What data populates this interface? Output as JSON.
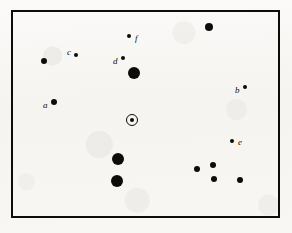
{
  "figure": {
    "type": "star-chart",
    "background_color": "#f7f6f3",
    "ink_color": "#0c0c08",
    "frame": {
      "x": 11,
      "y": 10,
      "width": 269,
      "height": 208,
      "border_width": 2
    }
  },
  "chart_data": {
    "type": "scatter",
    "title": "",
    "subtitle": "",
    "xlabel": "",
    "ylabel": "",
    "grid": false,
    "legend": "none",
    "axes_visible": false,
    "frame_visible": true,
    "xlim": [
      0,
      292
    ],
    "ylim": [
      0,
      233
    ],
    "note": "Positions are image pixel coordinates; y increases downward. Radius encodes apparent brightness (larger = brighter).",
    "marker_styles": [
      "filled-dot",
      "ringed-dot"
    ],
    "points": [
      {
        "id": "p1",
        "label": "",
        "x": 209,
        "y": 27,
        "r": 4.0,
        "style": "filled-dot",
        "label_dx": 0,
        "label_dy": 0
      },
      {
        "id": "p2",
        "label": "f",
        "x": 129,
        "y": 36,
        "r": 2.2,
        "style": "filled-dot",
        "label_dx": 6,
        "label_dy": -2
      },
      {
        "id": "p3",
        "label": "c",
        "x": 76,
        "y": 55,
        "r": 2.4,
        "style": "filled-dot",
        "label_dx": -9,
        "label_dy": -7
      },
      {
        "id": "p4",
        "label": "d",
        "x": 123,
        "y": 58,
        "r": 2.2,
        "style": "filled-dot",
        "label_dx": -10,
        "label_dy": -1
      },
      {
        "id": "p5",
        "label": "",
        "x": 44,
        "y": 61,
        "r": 3.3,
        "style": "filled-dot",
        "label_dx": 0,
        "label_dy": 0
      },
      {
        "id": "p6",
        "label": "",
        "x": 134,
        "y": 73,
        "r": 6.2,
        "style": "filled-dot",
        "label_dx": 0,
        "label_dy": 0
      },
      {
        "id": "p7",
        "label": "b",
        "x": 245,
        "y": 87,
        "r": 2.4,
        "style": "filled-dot",
        "label_dx": -10,
        "label_dy": -1
      },
      {
        "id": "p8",
        "label": "a",
        "x": 54,
        "y": 102,
        "r": 3.0,
        "style": "filled-dot",
        "label_dx": -11,
        "label_dy": -1
      },
      {
        "id": "p9",
        "label": "",
        "x": 132,
        "y": 120,
        "r": 6.0,
        "style": "ringed-dot",
        "label_dx": 0,
        "label_dy": 0,
        "core_r": 2.2
      },
      {
        "id": "p10",
        "label": "e",
        "x": 232,
        "y": 141,
        "r": 2.2,
        "style": "filled-dot",
        "label_dx": 6,
        "label_dy": -3
      },
      {
        "id": "p11",
        "label": "",
        "x": 118,
        "y": 159,
        "r": 6.0,
        "style": "filled-dot",
        "label_dx": 0,
        "label_dy": 0
      },
      {
        "id": "p12",
        "label": "",
        "x": 213,
        "y": 165,
        "r": 3.4,
        "style": "filled-dot",
        "label_dx": 0,
        "label_dy": 0
      },
      {
        "id": "p13",
        "label": "",
        "x": 197,
        "y": 169,
        "r": 3.2,
        "style": "filled-dot",
        "label_dx": 0,
        "label_dy": 0
      },
      {
        "id": "p14",
        "label": "",
        "x": 117,
        "y": 181,
        "r": 6.0,
        "style": "filled-dot",
        "label_dx": 0,
        "label_dy": 0
      },
      {
        "id": "p15",
        "label": "",
        "x": 214,
        "y": 179,
        "r": 3.0,
        "style": "filled-dot",
        "label_dx": 0,
        "label_dy": 0
      },
      {
        "id": "p16",
        "label": "",
        "x": 240,
        "y": 180,
        "r": 3.2,
        "style": "filled-dot",
        "label_dx": 0,
        "label_dy": 0
      }
    ],
    "labels": [
      {
        "text": "a",
        "x": 43,
        "y": 101
      },
      {
        "text": "b",
        "x": 235,
        "y": 86
      },
      {
        "text": "c",
        "x": 67,
        "y": 48
      },
      {
        "text": "d",
        "x": 113,
        "y": 57
      },
      {
        "text": "e",
        "x": 238,
        "y": 138
      },
      {
        "text": "f",
        "x": 135,
        "y": 34
      }
    ],
    "label_font_size": 9
  }
}
